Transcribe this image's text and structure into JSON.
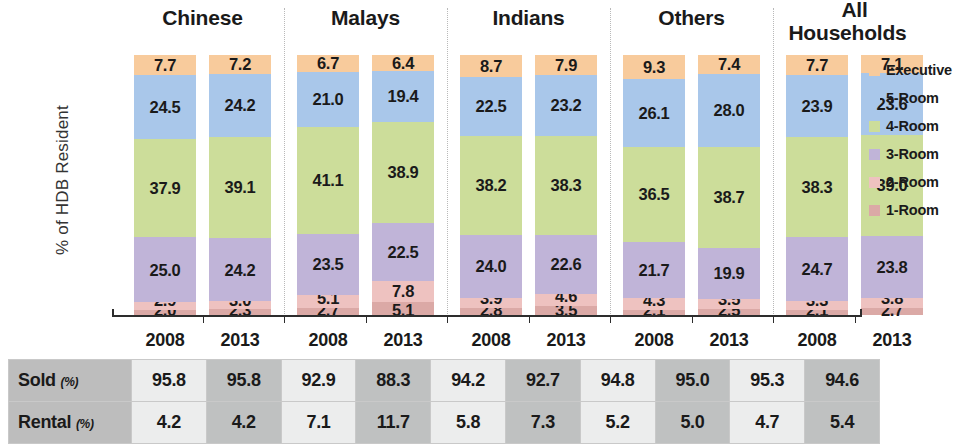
{
  "chart_data": {
    "type": "bar",
    "subtype": "stacked-bar-100",
    "title": "",
    "xlabel": "",
    "ylabel": "% of HDB Resident",
    "ylim": [
      0,
      100
    ],
    "grid": false,
    "legend_position": "right",
    "groups": [
      "Chinese",
      "Malays",
      "Indians",
      "Others",
      "All Households"
    ],
    "categories": [
      "Chinese 2008",
      "Chinese 2013",
      "Malays 2008",
      "Malays 2013",
      "Indians 2008",
      "Indians 2013",
      "Others 2008",
      "Others 2013",
      "All Households 2008",
      "All Households 2013"
    ],
    "x": [
      "2008",
      "2013",
      "2008",
      "2013",
      "2008",
      "2013",
      "2008",
      "2013",
      "2008",
      "2013"
    ],
    "series": [
      {
        "name": "Executive",
        "color": "#f8cb9c",
        "values": [
          7.7,
          7.2,
          6.7,
          6.4,
          8.7,
          7.9,
          9.3,
          7.4,
          7.7,
          7.1
        ]
      },
      {
        "name": "5-Room",
        "color": "#a9c7ea",
        "values": [
          24.5,
          24.2,
          21.0,
          19.4,
          22.5,
          23.2,
          26.1,
          28.0,
          23.9,
          23.6
        ]
      },
      {
        "name": "4-Room",
        "color": "#ccdd9a",
        "values": [
          37.9,
          39.1,
          41.1,
          38.9,
          38.2,
          38.3,
          36.5,
          38.7,
          38.3,
          39.0
        ]
      },
      {
        "name": "3-Room",
        "color": "#c0b4d8",
        "values": [
          25.0,
          24.2,
          23.5,
          22.5,
          24.0,
          22.6,
          21.7,
          19.9,
          24.7,
          23.8
        ]
      },
      {
        "name": "2-Room",
        "color": "#eec2c0",
        "values": [
          2.9,
          3.0,
          5.1,
          7.8,
          3.9,
          4.6,
          4.3,
          3.5,
          3.3,
          3.8
        ]
      },
      {
        "name": "1-Room",
        "color": "#dba9a6",
        "values": [
          2.0,
          2.3,
          2.7,
          5.1,
          2.8,
          3.5,
          2.1,
          2.5,
          2.1,
          2.7
        ]
      }
    ]
  },
  "axis": {
    "y_title": "% of HDB Resident"
  },
  "groups": [
    {
      "label": "Chinese",
      "two_line": false
    },
    {
      "label": "Malays",
      "two_line": false
    },
    {
      "label": "Indians",
      "two_line": false
    },
    {
      "label": "Others",
      "two_line": false
    },
    {
      "label_line1": "All",
      "label_line2": "Households",
      "two_line": true
    }
  ],
  "bars": [
    {
      "year": "2008",
      "segments": {
        "executive": "7.7",
        "room5": "24.5",
        "room4": "37.9",
        "room3": "25.0",
        "room2": "2.9",
        "room1": "2.0"
      }
    },
    {
      "year": "2013",
      "segments": {
        "executive": "7.2",
        "room5": "24.2",
        "room4": "39.1",
        "room3": "24.2",
        "room2": "3.0",
        "room1": "2.3"
      }
    },
    {
      "year": "2008",
      "segments": {
        "executive": "6.7",
        "room5": "21.0",
        "room4": "41.1",
        "room3": "23.5",
        "room2": "5.1",
        "room1": "2.7"
      }
    },
    {
      "year": "2013",
      "segments": {
        "executive": "6.4",
        "room5": "19.4",
        "room4": "38.9",
        "room3": "22.5",
        "room2": "7.8",
        "room1": "5.1"
      }
    },
    {
      "year": "2008",
      "segments": {
        "executive": "8.7",
        "room5": "22.5",
        "room4": "38.2",
        "room3": "24.0",
        "room2": "3.9",
        "room1": "2.8"
      }
    },
    {
      "year": "2013",
      "segments": {
        "executive": "7.9",
        "room5": "23.2",
        "room4": "38.3",
        "room3": "22.6",
        "room2": "4.6",
        "room1": "3.5"
      }
    },
    {
      "year": "2008",
      "segments": {
        "executive": "9.3",
        "room5": "26.1",
        "room4": "36.5",
        "room3": "21.7",
        "room2": "4.3",
        "room1": "2.1"
      }
    },
    {
      "year": "2013",
      "segments": {
        "executive": "7.4",
        "room5": "28.0",
        "room4": "38.7",
        "room3": "19.9",
        "room2": "3.5",
        "room1": "2.5"
      }
    },
    {
      "year": "2008",
      "segments": {
        "executive": "7.7",
        "room5": "23.9",
        "room4": "38.3",
        "room3": "24.7",
        "room2": "3.3",
        "room1": "2.1"
      }
    },
    {
      "year": "2013",
      "segments": {
        "executive": "7.1",
        "room5": "23.6",
        "room4": "39.0",
        "room3": "23.8",
        "room2": "3.8",
        "room1": "2.7"
      }
    }
  ],
  "x_labels": [
    "2008",
    "2013",
    "2008",
    "2013",
    "2008",
    "2013",
    "2008",
    "2013",
    "2008",
    "2013"
  ],
  "legend": {
    "items": [
      {
        "label": "Executive",
        "color": "#f8cb9c"
      },
      {
        "label": "5-Room",
        "color": "#a9c7ea"
      },
      {
        "label": "4-Room",
        "color": "#ccdd9a"
      },
      {
        "label": "3-Room",
        "color": "#c0b4d8"
      },
      {
        "label": "2-Room",
        "color": "#eec2c0"
      },
      {
        "label": "1-Room",
        "color": "#dba9a6"
      }
    ]
  },
  "table": {
    "header": [
      "2008",
      "2013",
      "2008",
      "2013",
      "2008",
      "2013",
      "2008",
      "2013",
      "2008",
      "2013"
    ],
    "rows": [
      {
        "label": "Sold",
        "unit": "(%)",
        "values": [
          "95.8",
          "95.8",
          "92.9",
          "88.3",
          "94.2",
          "92.7",
          "94.8",
          "95.0",
          "95.3",
          "94.6"
        ]
      },
      {
        "label": "Rental",
        "unit": "(%)",
        "values": [
          "4.2",
          "4.2",
          "7.1",
          "11.7",
          "5.8",
          "7.3",
          "5.2",
          "5.0",
          "4.7",
          "5.4"
        ]
      }
    ]
  }
}
